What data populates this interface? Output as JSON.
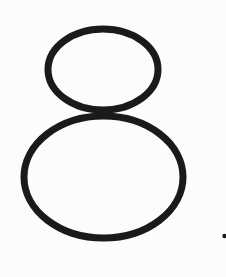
{
  "figure": {
    "glyph": "8",
    "stroke_color": "#1a1a1a",
    "background_color": "#fcfcfc",
    "stroke_width": 7,
    "upper_loop": {
      "cx": 103,
      "cy": 69.5,
      "rx": 55,
      "ry": 40.5
    },
    "lower_loop": {
      "cx": 103.5,
      "cy": 177,
      "rx": 79.5,
      "ry": 61
    },
    "mark": {
      "cx": 224.5,
      "cy": 236,
      "r": 2.2,
      "label": "."
    }
  }
}
